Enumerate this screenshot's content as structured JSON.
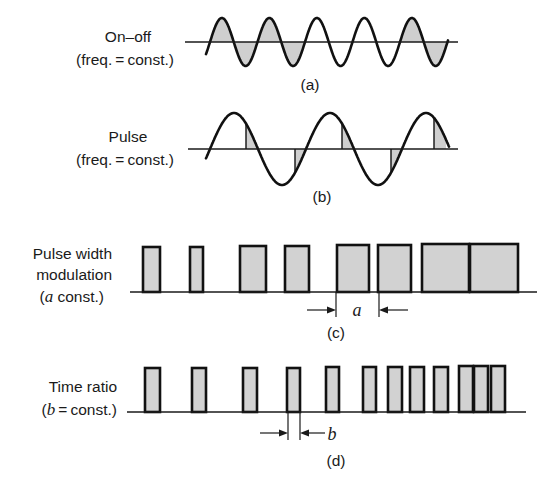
{
  "figure": {
    "panels": [
      {
        "id": "a",
        "caption": "(a)",
        "label_lines": [
          "On–off",
          "(freq. = const.)"
        ],
        "type": "sine-on-off",
        "cycles": 5,
        "shaded_cycles": [
          1,
          2,
          5
        ]
      },
      {
        "id": "b",
        "caption": "(b)",
        "label_lines": [
          "Pulse",
          "(freq. = const.)"
        ],
        "type": "sine-pulse",
        "cycles": 2.7
      },
      {
        "id": "c",
        "caption": "(c)",
        "label_lines": [
          "Pulse width",
          "modulation",
          "(a const.)"
        ],
        "label_italic_prefix": "a",
        "type": "pwm",
        "dimension_symbol": "a",
        "pulses": [
          {
            "x": 143,
            "w": 17,
            "top": 247
          },
          {
            "x": 190,
            "w": 13,
            "top": 247
          },
          {
            "x": 240,
            "w": 26,
            "top": 246
          },
          {
            "x": 285,
            "w": 24,
            "top": 246
          },
          {
            "x": 337,
            "w": 32,
            "top": 245
          },
          {
            "x": 378,
            "w": 33,
            "top": 245
          },
          {
            "x": 422,
            "w": 47,
            "top": 244
          },
          {
            "x": 470,
            "w": 48,
            "top": 244
          }
        ]
      },
      {
        "id": "d",
        "caption": "(d)",
        "label_lines": [
          "Time ratio",
          "(b = const.)"
        ],
        "type": "time-ratio",
        "dimension_symbol": "b",
        "pulses": [
          {
            "x": 145,
            "w": 15,
            "top": 368
          },
          {
            "x": 192,
            "w": 14,
            "top": 368
          },
          {
            "x": 243,
            "w": 14,
            "top": 368
          },
          {
            "x": 287,
            "w": 13,
            "top": 368
          },
          {
            "x": 326,
            "w": 13,
            "top": 367
          },
          {
            "x": 363,
            "w": 13,
            "top": 367
          },
          {
            "x": 388,
            "w": 14,
            "top": 367
          },
          {
            "x": 410,
            "w": 14,
            "top": 367
          },
          {
            "x": 434,
            "w": 14,
            "top": 367
          },
          {
            "x": 459,
            "w": 14,
            "top": 366
          },
          {
            "x": 474,
            "w": 14,
            "top": 366
          },
          {
            "x": 491,
            "w": 14,
            "top": 366
          }
        ]
      }
    ]
  },
  "labels": {
    "a_line1": "On–off",
    "a_line2": "(freq. = const.)",
    "a_caption": "(a)",
    "b_line1": "Pulse",
    "b_line2": "(freq. = const.)",
    "b_caption": "(b)",
    "c_line1": "Pulse width",
    "c_line2": "modulation",
    "c_line3_sym": "a",
    "c_line3_rest": " const.)",
    "c_caption": "(c)",
    "c_dim": "a",
    "d_line1": "Time ratio",
    "d_line2_sym": "b",
    "d_line2_rest": " = const.)",
    "d_caption": "(d)",
    "d_dim": "b",
    "open_paren": "("
  }
}
